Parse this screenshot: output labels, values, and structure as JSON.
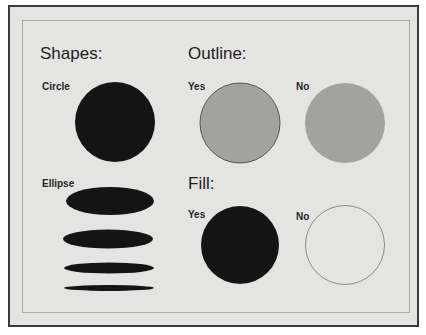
{
  "sections": {
    "shapes": {
      "title": "Shapes:",
      "circle_label": "Circle",
      "ellipse_label": "Ellipse"
    },
    "outline": {
      "title": "Outline:",
      "yes_label": "Yes",
      "no_label": "No"
    },
    "fill": {
      "title": "Fill:",
      "yes_label": "Yes",
      "no_label": "No"
    }
  },
  "colors": {
    "background": "#e4e4e2",
    "solid_fill": "#141414",
    "gray_fill": "#a2a2a0",
    "outline_stroke": "#555555",
    "empty_stroke": "#8a8a8a"
  }
}
